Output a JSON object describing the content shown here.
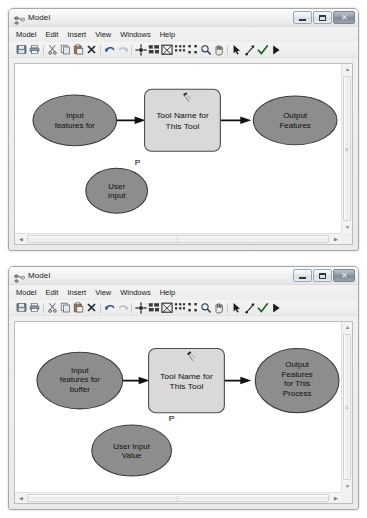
{
  "windows": [
    {
      "id": "model-window-top",
      "title": "Model",
      "title_icon": "model-diagram-icon",
      "menu": [
        "Model",
        "Edit",
        "Insert",
        "View",
        "Windows",
        "Help"
      ],
      "toolbar": [
        {
          "name": "save-icon",
          "glyph": "save"
        },
        {
          "name": "print-icon",
          "glyph": "print"
        },
        {
          "name": "sep",
          "glyph": "sep"
        },
        {
          "name": "cut-icon",
          "glyph": "cut"
        },
        {
          "name": "copy-icon",
          "glyph": "copy"
        },
        {
          "name": "paste-icon",
          "glyph": "paste"
        },
        {
          "name": "delete-icon",
          "glyph": "x"
        },
        {
          "name": "sep",
          "glyph": "sep"
        },
        {
          "name": "undo-icon",
          "glyph": "undo"
        },
        {
          "name": "redo-icon",
          "glyph": "redo"
        },
        {
          "name": "sep",
          "glyph": "sep"
        },
        {
          "name": "add-data-icon",
          "glyph": "adddata"
        },
        {
          "name": "auto-layout-icon",
          "glyph": "layout"
        },
        {
          "name": "full-extent-icon",
          "glyph": "fullextent"
        },
        {
          "name": "zoom-in-layout-icon",
          "glyph": "dots4a"
        },
        {
          "name": "zoom-out-layout-icon",
          "glyph": "dots4b"
        },
        {
          "name": "zoom-tool-icon",
          "glyph": "magnifier"
        },
        {
          "name": "pan-tool-icon",
          "glyph": "hand"
        },
        {
          "name": "sep",
          "glyph": "sep"
        },
        {
          "name": "select-tool-icon",
          "glyph": "arrow"
        },
        {
          "name": "connect-tool-icon",
          "glyph": "connect"
        },
        {
          "name": "validate-icon",
          "glyph": "check"
        },
        {
          "name": "run-icon",
          "glyph": "run"
        }
      ],
      "window_buttons": [
        {
          "name": "minimize-button",
          "label": "Minimize"
        },
        {
          "name": "maximize-button",
          "label": "Maximize"
        },
        {
          "name": "close-button",
          "label": "Close",
          "glyph": "✕"
        }
      ],
      "diagram": {
        "input_variable": {
          "lines": [
            "Input",
            "features for"
          ]
        },
        "tool": {
          "lines": [
            "Tool Name for",
            "This Tool"
          ]
        },
        "output_variable": {
          "lines": [
            "Output",
            "Features"
          ]
        },
        "user_variable": {
          "lines": [
            "User",
            "Input"
          ],
          "parameter_flag": "P"
        }
      }
    },
    {
      "id": "model-window-bottom",
      "title": "Model",
      "title_icon": "model-diagram-icon",
      "menu": [
        "Model",
        "Edit",
        "Insert",
        "View",
        "Windows",
        "Help"
      ],
      "toolbar": [
        {
          "name": "save-icon",
          "glyph": "save"
        },
        {
          "name": "print-icon",
          "glyph": "print"
        },
        {
          "name": "sep",
          "glyph": "sep"
        },
        {
          "name": "cut-icon",
          "glyph": "cut"
        },
        {
          "name": "copy-icon",
          "glyph": "copy"
        },
        {
          "name": "paste-icon",
          "glyph": "paste"
        },
        {
          "name": "delete-icon",
          "glyph": "x"
        },
        {
          "name": "sep",
          "glyph": "sep"
        },
        {
          "name": "undo-icon",
          "glyph": "undo"
        },
        {
          "name": "redo-icon",
          "glyph": "redo"
        },
        {
          "name": "sep",
          "glyph": "sep"
        },
        {
          "name": "add-data-icon",
          "glyph": "adddata"
        },
        {
          "name": "auto-layout-icon",
          "glyph": "layout"
        },
        {
          "name": "full-extent-icon",
          "glyph": "fullextent"
        },
        {
          "name": "zoom-in-layout-icon",
          "glyph": "dots4a"
        },
        {
          "name": "zoom-out-layout-icon",
          "glyph": "dots4b"
        },
        {
          "name": "zoom-tool-icon",
          "glyph": "magnifier"
        },
        {
          "name": "pan-tool-icon",
          "glyph": "hand"
        },
        {
          "name": "sep",
          "glyph": "sep"
        },
        {
          "name": "select-tool-icon",
          "glyph": "arrow"
        },
        {
          "name": "connect-tool-icon",
          "glyph": "connect"
        },
        {
          "name": "validate-icon",
          "glyph": "check"
        },
        {
          "name": "run-icon",
          "glyph": "run"
        }
      ],
      "window_buttons": [
        {
          "name": "minimize-button",
          "label": "Minimize"
        },
        {
          "name": "maximize-button",
          "label": "Maximize"
        },
        {
          "name": "close-button",
          "label": "Close",
          "glyph": "✕"
        }
      ],
      "diagram": {
        "input_variable": {
          "lines": [
            "Input",
            "features for",
            "buffer"
          ]
        },
        "tool": {
          "lines": [
            "Tool Name for",
            "This Tool"
          ]
        },
        "output_variable": {
          "lines": [
            "Output",
            "Features",
            "for This",
            "Process"
          ]
        },
        "user_variable": {
          "lines": [
            "User Input",
            "Value"
          ],
          "parameter_flag": "P"
        }
      }
    }
  ],
  "colors": {
    "variable_fill": "#8d8d8d",
    "variable_stroke": "#3a3a3a",
    "tool_fill": "#d9d9d9",
    "tool_stroke": "#4a4a4a",
    "arrow": "#111111",
    "canvas": "#ffffff"
  }
}
